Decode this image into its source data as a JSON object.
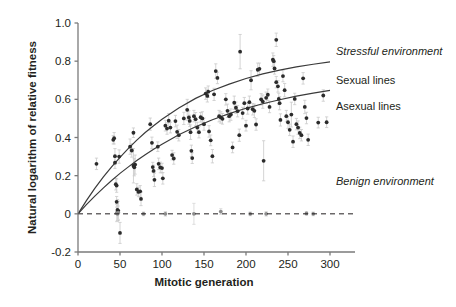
{
  "chart_data": {
    "type": "scatter",
    "title": "",
    "xlabel": "Mitotic generation",
    "ylabel": "Natural logarithm of relative fitness",
    "xlim": [
      0,
      320
    ],
    "ylim": [
      -0.2,
      1.0
    ],
    "xticks": [
      0,
      50,
      100,
      150,
      200,
      250,
      300
    ],
    "xtick_labels": [
      "0",
      "50",
      "100",
      "150",
      "200",
      "250",
      "300"
    ],
    "yticks": [
      -0.2,
      0,
      0.2,
      0.4,
      0.6,
      0.8,
      1.0
    ],
    "ytick_labels": [
      "-0.2",
      "0",
      "0.2",
      "0.4",
      "0.6",
      "0.8",
      "1.0"
    ],
    "grid": false,
    "legend_position": "right-inside",
    "zero_reference_line": {
      "y": 0,
      "style": "dashed",
      "color": "#231f20"
    },
    "annotations": [
      {
        "text": "Stressful environment",
        "x": 336,
        "y": 55,
        "style": "italic"
      },
      {
        "text": "Sexual lines",
        "x": 336,
        "y": 84,
        "style": "plain"
      },
      {
        "text": "Asexual lines",
        "x": 336,
        "y": 110,
        "style": "plain"
      },
      {
        "text": "Benign environment",
        "x": 336,
        "y": 185,
        "style": "italic"
      }
    ],
    "series": [
      {
        "name": "Sexual lines",
        "kind": "fit-curve",
        "color": "#3a3a3a",
        "model": "y = 0.80 * (1 - exp(-x/110))",
        "x": [
          0,
          10,
          20,
          30,
          40,
          50,
          60,
          70,
          80,
          90,
          100,
          120,
          140,
          160,
          180,
          200,
          220,
          240,
          260,
          280,
          300
        ],
        "y": [
          0.0,
          0.069,
          0.133,
          0.192,
          0.246,
          0.296,
          0.343,
          0.386,
          0.426,
          0.462,
          0.496,
          0.555,
          0.605,
          0.646,
          0.68,
          0.709,
          0.733,
          0.753,
          0.77,
          0.784,
          0.796
        ]
      },
      {
        "name": "Asexual lines",
        "kind": "fit-curve",
        "color": "#3a3a3a",
        "model": "y = 0.74 * (1 - exp(-x/150))",
        "x": [
          0,
          10,
          20,
          30,
          40,
          50,
          60,
          70,
          80,
          90,
          100,
          120,
          140,
          160,
          180,
          200,
          220,
          240,
          260,
          280,
          300
        ],
        "y": [
          0.0,
          0.048,
          0.093,
          0.135,
          0.175,
          0.212,
          0.246,
          0.279,
          0.309,
          0.338,
          0.365,
          0.414,
          0.456,
          0.493,
          0.525,
          0.553,
          0.577,
          0.598,
          0.617,
          0.633,
          0.647
        ]
      },
      {
        "name": "Stressful environment points",
        "kind": "scatter-errorbar",
        "marker": "filled-circle",
        "color": "#2b2b2b",
        "errorbar_color": "#c9c9c9",
        "points": [
          {
            "x": 22,
            "y": 0.262,
            "err": 0.03
          },
          {
            "x": 42,
            "y": 0.388,
            "err": 0.022
          },
          {
            "x": 43,
            "y": 0.396,
            "err": 0.03
          },
          {
            "x": 44,
            "y": 0.302,
            "err": 0.04
          },
          {
            "x": 44,
            "y": 0.268,
            "err": 0.03
          },
          {
            "x": 45,
            "y": 0.155,
            "err": 0.03
          },
          {
            "x": 46,
            "y": 0.148,
            "err": 0.035
          },
          {
            "x": 46,
            "y": 0.063,
            "err": 0.028
          },
          {
            "x": 47,
            "y": 0.02,
            "err": 0.055
          },
          {
            "x": 47,
            "y": 0.008,
            "err": 0.045
          },
          {
            "x": 48,
            "y": 0.016,
            "err": 0.05
          },
          {
            "x": 49,
            "y": 0.3,
            "err": 0.035
          },
          {
            "x": 50,
            "y": -0.1,
            "err": 0.055
          },
          {
            "x": 62,
            "y": 0.352,
            "err": 0.04
          },
          {
            "x": 64,
            "y": 0.332,
            "err": 0.035
          },
          {
            "x": 66,
            "y": 0.425,
            "err": 0.025
          },
          {
            "x": 66,
            "y": 0.252,
            "err": 0.09
          },
          {
            "x": 67,
            "y": 0.244,
            "err": 0.045
          },
          {
            "x": 68,
            "y": 0.258,
            "err": 0.05
          },
          {
            "x": 70,
            "y": 0.128,
            "err": 0.03
          },
          {
            "x": 72,
            "y": 0.115,
            "err": 0.025
          },
          {
            "x": 74,
            "y": 0.118,
            "err": 0.03
          },
          {
            "x": 75,
            "y": 0.078,
            "err": 0.035
          },
          {
            "x": 86,
            "y": 0.47,
            "err": 0.032
          },
          {
            "x": 88,
            "y": 0.372,
            "err": 0.03
          },
          {
            "x": 89,
            "y": 0.245,
            "err": 0.025
          },
          {
            "x": 90,
            "y": 0.225,
            "err": 0.03
          },
          {
            "x": 91,
            "y": 0.178,
            "err": 0.035
          },
          {
            "x": 95,
            "y": 0.352,
            "err": 0.025
          },
          {
            "x": 96,
            "y": 0.262,
            "err": 0.03
          },
          {
            "x": 98,
            "y": 0.243,
            "err": 0.028
          },
          {
            "x": 100,
            "y": 0.24,
            "err": 0.025
          },
          {
            "x": 101,
            "y": 0.186,
            "err": 0.03
          },
          {
            "x": 104,
            "y": 0.462,
            "err": 0.028
          },
          {
            "x": 106,
            "y": 0.447,
            "err": 0.03
          },
          {
            "x": 108,
            "y": 0.488,
            "err": 0.038
          },
          {
            "x": 110,
            "y": 0.452,
            "err": 0.028
          },
          {
            "x": 112,
            "y": 0.308,
            "err": 0.025
          },
          {
            "x": 114,
            "y": 0.29,
            "err": 0.03
          },
          {
            "x": 116,
            "y": 0.486,
            "err": 0.03
          },
          {
            "x": 118,
            "y": 0.43,
            "err": 0.035
          },
          {
            "x": 120,
            "y": 0.412,
            "err": 0.03
          },
          {
            "x": 126,
            "y": 0.5,
            "err": 0.032
          },
          {
            "x": 130,
            "y": 0.545,
            "err": 0.055
          },
          {
            "x": 132,
            "y": 0.505,
            "err": 0.035
          },
          {
            "x": 133,
            "y": 0.487,
            "err": 0.03
          },
          {
            "x": 134,
            "y": 0.428,
            "err": 0.038
          },
          {
            "x": 135,
            "y": 0.33,
            "err": 0.03
          },
          {
            "x": 136,
            "y": 0.292,
            "err": 0.028
          },
          {
            "x": 138,
            "y": 0.512,
            "err": 0.03
          },
          {
            "x": 140,
            "y": 0.496,
            "err": 0.035
          },
          {
            "x": 142,
            "y": 0.452,
            "err": 0.028
          },
          {
            "x": 144,
            "y": 0.428,
            "err": 0.03
          },
          {
            "x": 146,
            "y": 0.506,
            "err": 0.025
          },
          {
            "x": 148,
            "y": 0.5,
            "err": 0.035
          },
          {
            "x": 150,
            "y": 0.47,
            "err": 0.032
          },
          {
            "x": 152,
            "y": 0.63,
            "err": 0.03
          },
          {
            "x": 154,
            "y": 0.618,
            "err": 0.032
          },
          {
            "x": 155,
            "y": 0.64,
            "err": 0.03
          },
          {
            "x": 156,
            "y": 0.432,
            "err": 0.03
          },
          {
            "x": 158,
            "y": 0.385,
            "err": 0.028
          },
          {
            "x": 160,
            "y": 0.302,
            "err": 0.035
          },
          {
            "x": 162,
            "y": 0.626,
            "err": 0.032
          },
          {
            "x": 164,
            "y": 0.748,
            "err": 0.038
          },
          {
            "x": 166,
            "y": 0.712,
            "err": 0.03
          },
          {
            "x": 168,
            "y": 0.512,
            "err": 0.03
          },
          {
            "x": 170,
            "y": 0.505,
            "err": 0.03
          },
          {
            "x": 172,
            "y": 0.498,
            "err": 0.028
          },
          {
            "x": 176,
            "y": 0.6,
            "err": 0.03
          },
          {
            "x": 178,
            "y": 0.54,
            "err": 0.035
          },
          {
            "x": 180,
            "y": 0.512,
            "err": 0.03
          },
          {
            "x": 182,
            "y": 0.52,
            "err": 0.03
          },
          {
            "x": 184,
            "y": 0.348,
            "err": 0.028
          },
          {
            "x": 186,
            "y": 0.582,
            "err": 0.035
          },
          {
            "x": 188,
            "y": 0.556,
            "err": 0.03
          },
          {
            "x": 190,
            "y": 0.538,
            "err": 0.03
          },
          {
            "x": 192,
            "y": 0.412,
            "err": 0.032
          },
          {
            "x": 193,
            "y": 0.85,
            "err": 0.09
          },
          {
            "x": 196,
            "y": 0.528,
            "err": 0.03
          },
          {
            "x": 198,
            "y": 0.58,
            "err": 0.03
          },
          {
            "x": 200,
            "y": 0.462,
            "err": 0.028
          },
          {
            "x": 202,
            "y": 0.552,
            "err": 0.03
          },
          {
            "x": 204,
            "y": 0.585,
            "err": 0.032
          },
          {
            "x": 206,
            "y": 0.7,
            "err": 0.05
          },
          {
            "x": 208,
            "y": 0.548,
            "err": 0.03
          },
          {
            "x": 210,
            "y": 0.54,
            "err": 0.035
          },
          {
            "x": 212,
            "y": 0.468,
            "err": 0.03
          },
          {
            "x": 214,
            "y": 0.755,
            "err": 0.035
          },
          {
            "x": 216,
            "y": 0.76,
            "err": 0.03
          },
          {
            "x": 218,
            "y": 0.6,
            "err": 0.03
          },
          {
            "x": 220,
            "y": 0.588,
            "err": 0.035
          },
          {
            "x": 221,
            "y": 0.278,
            "err": 0.105
          },
          {
            "x": 224,
            "y": 0.608,
            "err": 0.03
          },
          {
            "x": 226,
            "y": 0.624,
            "err": 0.03
          },
          {
            "x": 228,
            "y": 0.56,
            "err": 0.03
          },
          {
            "x": 232,
            "y": 0.808,
            "err": 0.035
          },
          {
            "x": 233,
            "y": 0.8,
            "err": 0.03
          },
          {
            "x": 234,
            "y": 0.762,
            "err": 0.03
          },
          {
            "x": 236,
            "y": 0.912,
            "err": 0.035
          },
          {
            "x": 236,
            "y": 0.69,
            "err": 0.03
          },
          {
            "x": 238,
            "y": 0.668,
            "err": 0.03
          },
          {
            "x": 239,
            "y": 0.602,
            "err": 0.03
          },
          {
            "x": 240,
            "y": 0.58,
            "err": 0.035
          },
          {
            "x": 241,
            "y": 0.492,
            "err": 0.032
          },
          {
            "x": 244,
            "y": 0.722,
            "err": 0.03
          },
          {
            "x": 246,
            "y": 0.648,
            "err": 0.035
          },
          {
            "x": 248,
            "y": 0.512,
            "err": 0.03
          },
          {
            "x": 250,
            "y": 0.48,
            "err": 0.032
          },
          {
            "x": 252,
            "y": 0.44,
            "err": 0.03
          },
          {
            "x": 254,
            "y": 0.52,
            "err": 0.065
          },
          {
            "x": 256,
            "y": 0.378,
            "err": 0.03
          },
          {
            "x": 258,
            "y": 0.602,
            "err": 0.03
          },
          {
            "x": 260,
            "y": 0.47,
            "err": 0.03
          },
          {
            "x": 262,
            "y": 0.452,
            "err": 0.035
          },
          {
            "x": 264,
            "y": 0.424,
            "err": 0.03
          },
          {
            "x": 266,
            "y": 0.412,
            "err": 0.03
          },
          {
            "x": 268,
            "y": 0.71,
            "err": 0.03
          },
          {
            "x": 270,
            "y": 0.56,
            "err": 0.035
          },
          {
            "x": 272,
            "y": 0.502,
            "err": 0.03
          },
          {
            "x": 274,
            "y": 0.388,
            "err": 0.03
          },
          {
            "x": 286,
            "y": 0.478,
            "err": 0.028
          },
          {
            "x": 292,
            "y": 0.62,
            "err": 0.03
          },
          {
            "x": 296,
            "y": 0.48,
            "err": 0.028
          }
        ]
      },
      {
        "name": "Benign environment points",
        "kind": "scatter-errorbar",
        "marker": "filled-circle",
        "color": "#8c8c8c",
        "errorbar_color": "#d6d6d6",
        "points": [
          {
            "x": 46,
            "y": 0.004,
            "err": 0.045
          },
          {
            "x": 47,
            "y": 0.0,
            "err": 0.04
          },
          {
            "x": 48,
            "y": 0.006,
            "err": 0.035
          },
          {
            "x": 78,
            "y": 0.0,
            "err": 0.01
          },
          {
            "x": 104,
            "y": 0.0,
            "err": 0.012
          },
          {
            "x": 138,
            "y": 0.0,
            "err": 0.055
          },
          {
            "x": 170,
            "y": 0.012,
            "err": 0.015
          },
          {
            "x": 205,
            "y": 0.0,
            "err": 0.01
          },
          {
            "x": 224,
            "y": 0.0,
            "err": 0.012
          },
          {
            "x": 272,
            "y": 0.002,
            "err": 0.01
          },
          {
            "x": 280,
            "y": 0.0,
            "err": 0.01
          }
        ]
      }
    ]
  }
}
